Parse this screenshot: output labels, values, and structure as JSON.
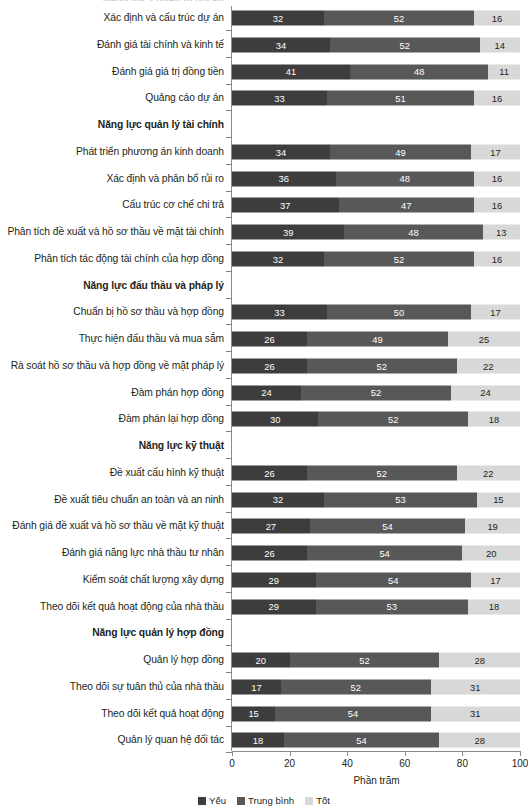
{
  "chart_data": {
    "type": "bar",
    "subtype": "stacked-horizontal-100",
    "title": "",
    "clipped_top_label": "Năng lực chuẩn bị dự án",
    "xlabel": "Phần trăm",
    "ylabel": "",
    "xlim": [
      0,
      100
    ],
    "xticks": [
      0,
      20,
      40,
      60,
      80,
      100
    ],
    "grid": false,
    "legend_position": "bottom-center",
    "series": [
      {
        "name": "Yếu",
        "color": "#3d3d3d"
      },
      {
        "name": "Trung bình",
        "color": "#585858"
      },
      {
        "name": "Tốt",
        "color": "#d8d8d8"
      }
    ],
    "rows": [
      {
        "type": "bar",
        "label": "Xác định và cấu trúc dự án",
        "values": [
          32,
          52,
          16
        ]
      },
      {
        "type": "bar",
        "label": "Đánh giá tài chính và kinh tế",
        "values": [
          34,
          52,
          14
        ]
      },
      {
        "type": "bar",
        "label": "Đánh giá giá trị đồng tiền",
        "values": [
          41,
          48,
          11
        ]
      },
      {
        "type": "bar",
        "label": "Quảng cáo dự án",
        "values": [
          33,
          51,
          16
        ]
      },
      {
        "type": "group",
        "label": "Năng lực quản lý tài chính",
        "values": []
      },
      {
        "type": "bar",
        "label": "Phát triển phương án kinh doanh",
        "values": [
          34,
          49,
          17
        ]
      },
      {
        "type": "bar",
        "label": "Xác định và phân bổ rủi ro",
        "values": [
          36,
          48,
          16
        ]
      },
      {
        "type": "bar",
        "label": "Cấu trúc cơ chế chi trả",
        "values": [
          37,
          47,
          16
        ]
      },
      {
        "type": "bar",
        "label": "Phân tích đề xuất và hồ sơ thầu về mặt tài chính",
        "values": [
          39,
          48,
          13
        ]
      },
      {
        "type": "bar",
        "label": "Phân tích tác động tài chính của hợp đồng",
        "values": [
          32,
          52,
          16
        ]
      },
      {
        "type": "group",
        "label": "Năng lực đấu thầu và pháp lý",
        "values": []
      },
      {
        "type": "bar",
        "label": "Chuẩn bị hồ sơ thầu và hợp đồng",
        "values": [
          33,
          50,
          17
        ]
      },
      {
        "type": "bar",
        "label": "Thực hiện đấu thầu và mua sắm",
        "values": [
          26,
          49,
          25
        ]
      },
      {
        "type": "bar",
        "label": "Rà soát hồ sơ thầu và hợp đồng về mặt pháp lý",
        "values": [
          26,
          52,
          22
        ]
      },
      {
        "type": "bar",
        "label": "Đàm phán hợp đồng",
        "values": [
          24,
          52,
          24
        ]
      },
      {
        "type": "bar",
        "label": "Đàm phán lại hợp đồng",
        "values": [
          30,
          52,
          18
        ]
      },
      {
        "type": "group",
        "label": "Năng lực kỹ thuật",
        "values": []
      },
      {
        "type": "bar",
        "label": "Đề xuất cấu hình kỹ thuật",
        "values": [
          26,
          52,
          22
        ]
      },
      {
        "type": "bar",
        "label": "Đề xuất tiêu chuẩn an toàn và an ninh",
        "values": [
          32,
          53,
          15
        ]
      },
      {
        "type": "bar",
        "label": "Đánh giá đề xuất và hồ sơ thầu về mặt kỹ thuật",
        "values": [
          27,
          54,
          19
        ]
      },
      {
        "type": "bar",
        "label": "Đánh giá năng lực nhà thầu tư nhân",
        "values": [
          26,
          54,
          20
        ]
      },
      {
        "type": "bar",
        "label": "Kiểm soát chất lượng xây dựng",
        "values": [
          29,
          54,
          17
        ]
      },
      {
        "type": "bar",
        "label": "Theo dõi kết quả hoạt động của nhà thầu",
        "values": [
          29,
          53,
          18
        ]
      },
      {
        "type": "group",
        "label": "Năng lực quản lý hợp đồng",
        "values": []
      },
      {
        "type": "bar",
        "label": "Quản lý hợp đồng",
        "values": [
          20,
          52,
          28
        ]
      },
      {
        "type": "bar",
        "label": "Theo dõi sự tuân thủ của nhà thầu",
        "values": [
          17,
          52,
          31
        ]
      },
      {
        "type": "bar",
        "label": "Theo dõi kết quả hoạt động",
        "values": [
          15,
          54,
          31
        ]
      },
      {
        "type": "bar",
        "label": "Quản lý quan hệ đối tác",
        "values": [
          18,
          54,
          28
        ]
      }
    ]
  }
}
